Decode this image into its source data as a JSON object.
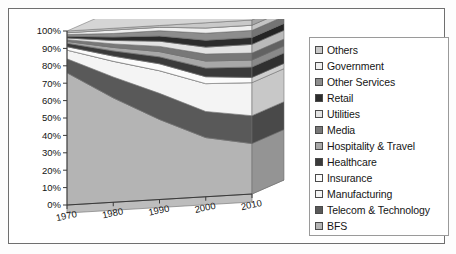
{
  "figure": {
    "border_color": "#6f6f6f",
    "background": "#ffffff"
  },
  "chart_data": {
    "type": "area",
    "stacked": true,
    "normalized_percent": true,
    "three_d": true,
    "title": "",
    "subtitle": "",
    "xlabel": "",
    "ylabel": "",
    "x": [
      1970,
      1980,
      1990,
      2000,
      2010
    ],
    "xtick_labels": [
      "1970",
      "1980",
      "1990",
      "2000",
      "2010"
    ],
    "ylim": [
      0,
      100
    ],
    "ytick_labels": [
      "0%",
      "10%",
      "20%",
      "30%",
      "40%",
      "50%",
      "60%",
      "70%",
      "80%",
      "90%",
      "100%"
    ],
    "ytick_values": [
      0,
      10,
      20,
      30,
      40,
      50,
      60,
      70,
      80,
      90,
      100
    ],
    "grid": false,
    "legend_position": "right",
    "series_order_bottom_to_top": [
      "BFS",
      "Telecom & Technology",
      "Manufacturing",
      "Insurance",
      "Healthcare",
      "Hospitality & Travel",
      "Media",
      "Utilities",
      "Retail",
      "Other Services",
      "Government",
      "Others"
    ],
    "series": [
      {
        "name": "BFS",
        "color": "#b4b4b4",
        "values": [
          76,
          60,
          46,
          34,
          29
        ]
      },
      {
        "name": "Telecom & Technology",
        "color": "#595959",
        "values": [
          8,
          12,
          15,
          15,
          16
        ]
      },
      {
        "name": "Manufacturing",
        "color": "#f4f4f4",
        "values": [
          5,
          9,
          13,
          16,
          19
        ]
      },
      {
        "name": "Insurance",
        "color": "#fbfbfb",
        "values": [
          2,
          3,
          4,
          4,
          3
        ]
      },
      {
        "name": "Healthcare",
        "color": "#3a3a3a",
        "values": [
          2,
          3,
          4,
          5,
          6
        ]
      },
      {
        "name": "Hospitality & Travel",
        "color": "#a8a8a8",
        "values": [
          1,
          2,
          3,
          4,
          4
        ]
      },
      {
        "name": "Media",
        "color": "#787878",
        "values": [
          1,
          2,
          3,
          4,
          4
        ]
      },
      {
        "name": "Utilities",
        "color": "#e3e3e3",
        "values": [
          1,
          2,
          3,
          4,
          5
        ]
      },
      {
        "name": "Retail",
        "color": "#2c2c2c",
        "values": [
          1,
          2,
          3,
          4,
          4
        ]
      },
      {
        "name": "Other Services",
        "color": "#8d8d8d",
        "values": [
          1,
          2,
          3,
          4,
          4
        ]
      },
      {
        "name": "Government",
        "color": "#efefef",
        "values": [
          1,
          2,
          2,
          3,
          3
        ]
      },
      {
        "name": "Others",
        "color": "#c9c9c9",
        "values": [
          1,
          1,
          1,
          3,
          3
        ]
      }
    ]
  },
  "legend": {
    "items": [
      {
        "label": "Others",
        "color": "#c9c9c9"
      },
      {
        "label": "Government",
        "color": "#efefef"
      },
      {
        "label": "Other Services",
        "color": "#8d8d8d"
      },
      {
        "label": "Retail",
        "color": "#2c2c2c"
      },
      {
        "label": "Utilities",
        "color": "#e3e3e3"
      },
      {
        "label": "Media",
        "color": "#787878"
      },
      {
        "label": "Hospitality & Travel",
        "color": "#a8a8a8"
      },
      {
        "label": "Healthcare",
        "color": "#3a3a3a"
      },
      {
        "label": "Insurance",
        "color": "#fbfbfb"
      },
      {
        "label": "Manufacturing",
        "color": "#f4f4f4"
      },
      {
        "label": "Telecom & Technology",
        "color": "#595959"
      },
      {
        "label": "BFS",
        "color": "#b4b4b4"
      }
    ]
  }
}
